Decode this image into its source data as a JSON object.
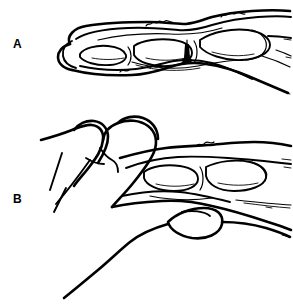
{
  "figure": {
    "background_color": "#ffffff",
    "ink_color": "#000000",
    "width": 293,
    "height": 306
  },
  "panels": [
    {
      "id": "A",
      "label": "A",
      "caption": "Lateral view of finger showing phalangeal bones, joints and soft tissue outline",
      "label_x": 13,
      "label_y": 38
    },
    {
      "id": "B",
      "label": "B",
      "caption": "Examiner's thumb and fingers grasping the finger in lateral view",
      "label_x": 13,
      "label_y": 193
    }
  ]
}
